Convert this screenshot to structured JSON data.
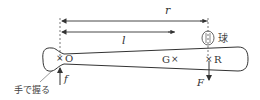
{
  "diagram": {
    "labels": {
      "r": "r",
      "l": "l",
      "O": "O",
      "G": "G",
      "R": "R",
      "ball": "球",
      "F": "F",
      "f": "f",
      "grip": "手で握る"
    },
    "marks": {
      "cross": "×"
    },
    "colors": {
      "line": "#333333",
      "dashed": "#555555",
      "background": "#ffffff"
    }
  }
}
